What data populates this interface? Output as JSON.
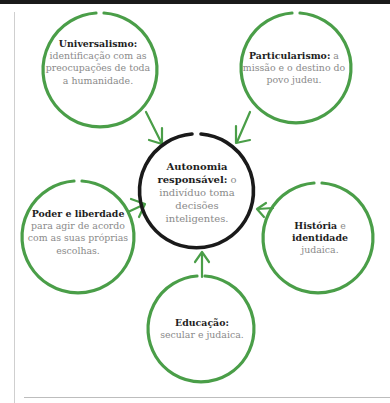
{
  "colors": {
    "green": "#4a9e48",
    "black": "#1a1a1a",
    "body_text": "#8a8a8a",
    "bold_text": "#1e1e1e"
  },
  "center": {
    "title": "Autonomia responsável:",
    "body": "o indivíduo toma decisões inteligentes."
  },
  "nodes": [
    {
      "id": "universalismo",
      "title": "Universalismo:",
      "body": "identificação com as preocupações de toda a humanidade."
    },
    {
      "id": "particularismo",
      "title": "Particularismo:",
      "body": "a missão e o destino do povo judeu."
    },
    {
      "id": "poder",
      "title": "Poder e liberdade",
      "body": "para agir de acordo com as suas próprias escolhas."
    },
    {
      "id": "historia",
      "title_a": "História",
      "mid": "e",
      "title_b": "identidade",
      "body": "judaica."
    },
    {
      "id": "educacao",
      "title": "Educação:",
      "body": "secular e judaica."
    }
  ]
}
